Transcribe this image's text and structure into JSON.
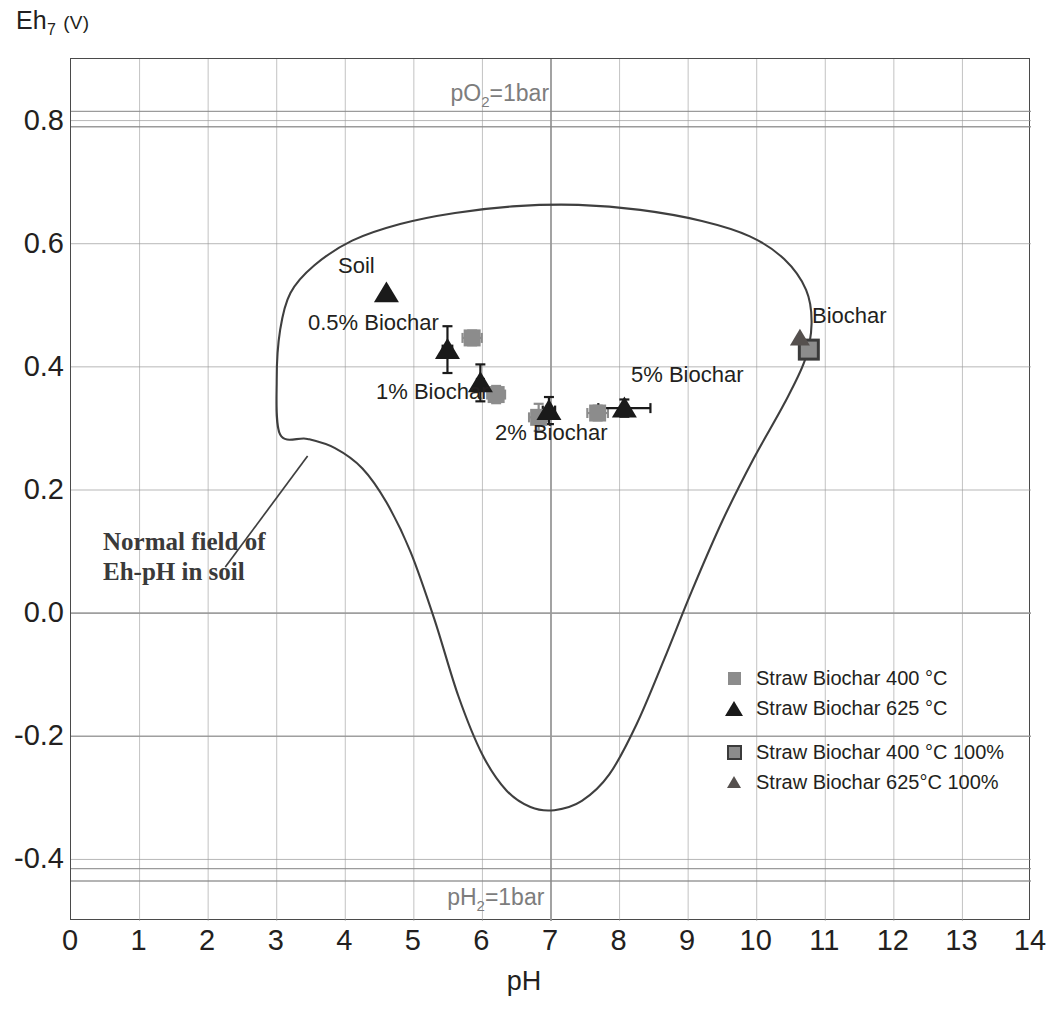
{
  "axes": {
    "y_title_main": "Eh",
    "y_title_sub": "7",
    "y_title_unit": "(V)",
    "x_title": "pH",
    "x_ticks": [
      "0",
      "1",
      "2",
      "3",
      "4",
      "5",
      "6",
      "7",
      "8",
      "9",
      "10",
      "11",
      "12",
      "13",
      "14"
    ],
    "y_ticks": [
      "0.8",
      "0.6",
      "0.4",
      "0.2",
      "0.0",
      "-0.2",
      "-0.4"
    ]
  },
  "gas_lines": {
    "upper_label_prefix": "pO",
    "upper_label_sub": "2",
    "upper_label_suffix": "=1bar",
    "lower_label_prefix": "pH",
    "lower_label_sub": "2",
    "lower_label_suffix": "=1bar",
    "color": "#8a8a8a"
  },
  "annotation": {
    "line1": "Normal field of",
    "line2": "Eh-pH in soil"
  },
  "point_labels": {
    "soil": "Soil",
    "b05": "0.5% Biochar",
    "b1": "1% Biochar",
    "b2": "2% Biochar",
    "b5": "5% Biochar",
    "biochar": "Biochar"
  },
  "legend": {
    "items": [
      {
        "label": "Straw Biochar 400 °C",
        "marker": "small-gray-square"
      },
      {
        "label": "Straw Biochar 625 °C",
        "marker": "black-triangle"
      },
      {
        "label": "Straw Biochar 400 °C 100%",
        "marker": "outlined-gray-square"
      },
      {
        "label": "Straw Biochar 625°C 100%",
        "marker": "gray-triangle"
      }
    ]
  },
  "colors": {
    "marker_400": "#8c8c8c",
    "marker_625": "#1a1a1a",
    "axis": "#4a4a4a",
    "grid": "#9a9a9a",
    "envelope": "#3f3f3f",
    "gas_line": "#8a8a8a"
  },
  "chart_data": {
    "type": "scatter",
    "title": "",
    "xlabel": "pH",
    "ylabel": "Eh7 (V)",
    "xlim": [
      0,
      14
    ],
    "ylim": [
      -0.5,
      0.9
    ],
    "grid": true,
    "legend_position": "lower-right-inside",
    "series": [
      {
        "name": "Straw Biochar 400 °C",
        "marker": "small-gray-square",
        "color": "#8c8c8c",
        "points": [
          {
            "group": "0.5% Biochar",
            "x": 5.85,
            "y": 0.447,
            "xerr": 0.14,
            "yerr": 0.012
          },
          {
            "group": "1% Biochar",
            "x": 6.2,
            "y": 0.355,
            "xerr": 0.13,
            "yerr": 0.014
          },
          {
            "group": "2% Biochar",
            "x": 6.82,
            "y": 0.318,
            "xerr": 0.14,
            "yerr": 0.022
          },
          {
            "group": "5% Biochar",
            "x": 7.68,
            "y": 0.325,
            "xerr": 0.15,
            "yerr": 0.012
          }
        ]
      },
      {
        "name": "Straw Biochar 625 °C",
        "marker": "black-triangle",
        "color": "#1a1a1a",
        "points": [
          {
            "group": "Soil",
            "x": 4.6,
            "y": 0.52,
            "xerr": 0.0,
            "yerr": 0.0
          },
          {
            "group": "0.5% Biochar",
            "x": 5.49,
            "y": 0.428,
            "xerr": 0.07,
            "yerr": 0.038
          },
          {
            "group": "1% Biochar",
            "x": 5.97,
            "y": 0.374,
            "xerr": 0.05,
            "yerr": 0.03
          },
          {
            "group": "2% Biochar",
            "x": 6.97,
            "y": 0.329,
            "xerr": 0.09,
            "yerr": 0.022
          },
          {
            "group": "5% Biochar",
            "x": 8.07,
            "y": 0.333,
            "xerr": 0.38,
            "yerr": 0.014
          }
        ]
      },
      {
        "name": "Straw Biochar 400 °C 100%",
        "marker": "outlined-gray-square",
        "color": "#8c8c8c",
        "points": [
          {
            "group": "Biochar",
            "x": 10.76,
            "y": 0.428,
            "xerr": 0.0,
            "yerr": 0.0
          }
        ]
      },
      {
        "name": "Straw Biochar 625°C 100%",
        "marker": "gray-triangle",
        "color": "#55504e",
        "points": [
          {
            "group": "Biochar",
            "x": 10.63,
            "y": 0.447,
            "xerr": 0.0,
            "yerr": 0.0
          }
        ]
      }
    ],
    "reference_lines": [
      {
        "name": "pO2=1bar",
        "y": 0.79,
        "style": "horizontal-gray"
      },
      {
        "name": "pO2=1bar-upper",
        "y": 0.815,
        "style": "horizontal-gray"
      },
      {
        "name": "pH2=1bar",
        "y": -0.415,
        "style": "horizontal-gray"
      },
      {
        "name": "pH2=1bar-lower",
        "y": -0.435,
        "style": "horizontal-gray"
      }
    ],
    "envelope": {
      "name": "Normal field of Eh-pH in soil",
      "closed": true,
      "vertices": [
        [
          3.05,
          0.29
        ],
        [
          3.0,
          0.38
        ],
        [
          3.05,
          0.46
        ],
        [
          3.2,
          0.52
        ],
        [
          3.55,
          0.565
        ],
        [
          4.1,
          0.605
        ],
        [
          4.8,
          0.632
        ],
        [
          5.6,
          0.65
        ],
        [
          6.5,
          0.661
        ],
        [
          7.4,
          0.663
        ],
        [
          8.3,
          0.655
        ],
        [
          9.2,
          0.637
        ],
        [
          9.9,
          0.612
        ],
        [
          10.4,
          0.575
        ],
        [
          10.72,
          0.525
        ],
        [
          10.8,
          0.47
        ],
        [
          10.7,
          0.41
        ],
        [
          10.4,
          0.34
        ],
        [
          9.95,
          0.25
        ],
        [
          9.5,
          0.15
        ],
        [
          9.05,
          0.035
        ],
        [
          8.65,
          -0.075
        ],
        [
          8.25,
          -0.18
        ],
        [
          7.85,
          -0.262
        ],
        [
          7.45,
          -0.305
        ],
        [
          7.05,
          -0.32
        ],
        [
          6.7,
          -0.315
        ],
        [
          6.35,
          -0.288
        ],
        [
          6.0,
          -0.23
        ],
        [
          5.65,
          -0.135
        ],
        [
          5.3,
          -0.01
        ],
        [
          4.95,
          0.1
        ],
        [
          4.6,
          0.18
        ],
        [
          4.25,
          0.235
        ],
        [
          3.85,
          0.268
        ],
        [
          3.45,
          0.283
        ],
        [
          3.05,
          0.29
        ]
      ]
    }
  }
}
